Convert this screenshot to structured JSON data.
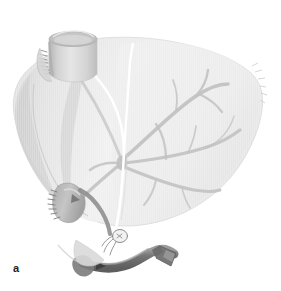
{
  "figure": {
    "panel_label": "a",
    "caption_alt": "Liver with inferior vena cava stump, portal venous tree, ligated vessel stump and cannulated tube",
    "background_color": "#ffffff"
  },
  "palette": {
    "parenchyma_light": "#f0f0f0",
    "parenchyma_mid": "#e4e4e4",
    "parenchyma_shadow": "#d2d2d2",
    "parenchyma_deep_shadow": "#c0c0c0",
    "vessel_gray": "#c3c3c3",
    "vessel_gray_dark": "#b0b0b0",
    "cava_cylinder": "#dcdcdc",
    "cava_rim": "#b6b6b6",
    "cava_lumen": "#c9c9c9",
    "tube_dark": "#6a6a6a",
    "tube_mid": "#808080",
    "tube_highlight": "#a8a8a8",
    "ligament_white": "#ffffff",
    "suture_gray": "#9a9a9a",
    "outline_gray": "#bdbdbd",
    "label_color": "#222222"
  },
  "structures": {
    "liver": {
      "name": "liver-parenchyma",
      "description": "Large shaded liver silhouette occupying most of the frame"
    },
    "right_lobe": {
      "name": "right-hepatic-lobe",
      "description": "Broad right lobe extending to the right edge with ragged capsular margin"
    },
    "left_lobe": {
      "name": "left-hepatic-lobe",
      "description": "Narrow left lobe sweeping down to the lower left"
    },
    "vena_cava_stump": {
      "name": "inferior-vena-cava-stump",
      "description": "Cylindrical vessel stump at the superior margin with open elliptical lumen"
    },
    "cava_suture_line": {
      "name": "cava-suture-line",
      "description": "Row of fine staple or suture marks on the left side of the cava stump"
    },
    "falciform_ligament": {
      "name": "falciform-ligament",
      "description": "White line descending from the cava stump dividing right and left lobes"
    },
    "portal_tree": {
      "name": "portal-venous-tree",
      "description": "Branching gray vascular tree radiating through the right lobe from the hilum"
    },
    "hilar_confluence": {
      "name": "hilar-confluence",
      "description": "Central branch point of the portal vessels near the middle of the organ"
    },
    "ligated_stump": {
      "name": "ligated-vessel-stump",
      "description": "Short vessel stump on the left, closed with a stapled suture row"
    },
    "ligature_knot": {
      "name": "ligature-knot",
      "description": "Small tied suture knot with free ends near the inferior border"
    },
    "cannula_tube": {
      "name": "cannula-tube",
      "description": "Dark curved tube running along the inferior border"
    },
    "tube_connector": {
      "name": "tube-connector",
      "description": "Angled connector fitting at the right end of the tube"
    },
    "tube_arrow": {
      "name": "tube-flow-arrow",
      "description": "Small arrowhead marking flow direction on the tube"
    }
  }
}
